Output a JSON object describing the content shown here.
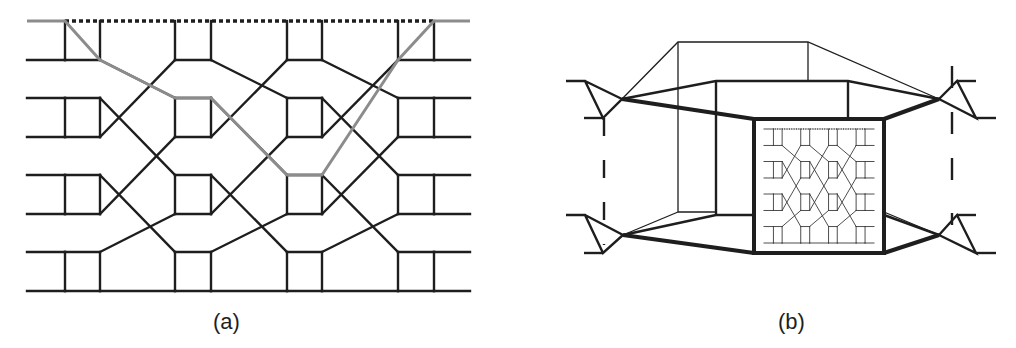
{
  "figure": {
    "panels": [
      {
        "id": "a",
        "caption": "(a)",
        "description": "Multistage interconnection network (butterfly/Benes-like) with 8 rows and 4 switch blocks; a highlighted gray routing path traverses the network"
      },
      {
        "id": "b",
        "caption": "(b)",
        "description": "Recursive view: the network of panel (a) drawn as a miniature inside a bold square, with surrounding nested frames and triangular connectors on either side"
      }
    ]
  },
  "colors": {
    "line": "#1e1e1e",
    "highlight_path": "#8c8c8c",
    "background": "#ffffff"
  },
  "panel_a": {
    "rows_y": [
      21,
      60,
      98,
      137,
      175,
      214,
      252,
      291
    ],
    "blocks": [
      {
        "left": 65,
        "right": 100
      },
      {
        "left": 175,
        "right": 211
      },
      {
        "left": 287,
        "right": 322
      },
      {
        "left": 398,
        "right": 434
      }
    ],
    "x_start": 27,
    "x_end": 470,
    "wiring_between_blocks": [
      {
        "from_row": 1,
        "to_row": 2
      },
      {
        "from_row": 2,
        "to_row": 4
      },
      {
        "from_row": 3,
        "to_row": 1
      },
      {
        "from_row": 4,
        "to_row": 6
      },
      {
        "from_row": 5,
        "to_row": 3
      },
      {
        "from_row": 6,
        "to_row": 5
      }
    ],
    "highlight_path_points": [
      [
        27,
        21
      ],
      [
        65,
        21
      ],
      [
        100,
        60
      ],
      [
        175,
        98
      ],
      [
        211,
        98
      ],
      [
        287,
        175
      ],
      [
        322,
        175
      ],
      [
        398,
        60
      ],
      [
        434,
        21
      ],
      [
        470,
        21
      ]
    ]
  }
}
